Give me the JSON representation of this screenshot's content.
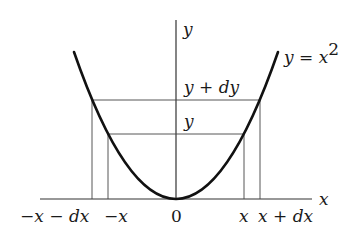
{
  "diagram": {
    "type": "parabola-differential",
    "curve_label": "y = x^2",
    "curve_label_parts": {
      "lhs": "y",
      "eq": " = ",
      "rhs": "x",
      "exp": "2"
    },
    "axes": {
      "x_label": "x",
      "y_label": "y",
      "origin_label": "0"
    },
    "x_ticks": {
      "neg_x_minus_dx": "−x − dx",
      "neg_x": "−x",
      "x": "x",
      "x_plus_dx": "x + dx"
    },
    "y_ticks": {
      "y": "y",
      "y_plus_dy": "y + dy"
    },
    "colors": {
      "curve": "#111111",
      "lines": "#333333",
      "background": "#ffffff"
    }
  }
}
